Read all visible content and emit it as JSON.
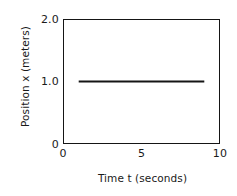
{
  "chart_data": {
    "type": "line",
    "title": "",
    "subtitle": "",
    "xlabel": "Time t (seconds)",
    "ylabel": "Position x (meters)",
    "xlim": [
      0,
      10
    ],
    "ylim": [
      0,
      2.0
    ],
    "xticks": [
      "0",
      "5",
      "10"
    ],
    "xtick_values": [
      0,
      5,
      10
    ],
    "yticks": [
      "2.0",
      "1.0",
      "0"
    ],
    "ytick_values": [
      2.0,
      1.0,
      0
    ],
    "grid": false,
    "legend": false,
    "legend_position": "none",
    "frame": true,
    "line_color": "#151515",
    "axis_color": "#151515",
    "background": "#ffffff",
    "series": [
      {
        "name": "Position x",
        "x": [
          1.0,
          9.0
        ],
        "values": [
          1.0,
          1.0
        ],
        "x_start": 1.0,
        "x_end": 9.0,
        "y_constant": 1.0,
        "style": "solid",
        "marker": "none"
      }
    ],
    "annotations": []
  }
}
